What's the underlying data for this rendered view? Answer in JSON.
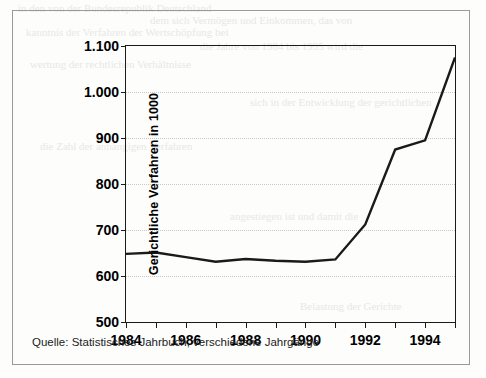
{
  "figure": {
    "background_color": "#fdfdfc",
    "border_color": "#9a9a9a",
    "line_color": "#1a1a1a",
    "grid_color": "#c9c9c9"
  },
  "source_note": "Quelle: Statistisches Jahrbuch, verschiedene Jahrgänge",
  "bleed_text": [
    "in den von der Bundesrepublik Deutschland",
    "dem sich Vermögen und Einkommen, das von",
    "kanntnis der Verfahren der Wertschöpfung bei",
    "die Jahre von 1984 bis 1995 wird die",
    "wertung der rechtlichen Verhältnisse",
    "sich in der Entwicklung der gerichtlichen",
    "die Zahl der anhängigen Verfahren",
    "angestiegen ist und damit die",
    "Belastung der Gerichte"
  ],
  "chart_data": {
    "type": "line",
    "title": "",
    "subtitle": "",
    "xlabel": "",
    "ylabel": "Gerichtliche Verfahren in 1000",
    "xlim": [
      1984,
      1995
    ],
    "ylim": [
      500,
      1100
    ],
    "grid": true,
    "legend": false,
    "legend_position": "none",
    "y_ticks": [
      500,
      600,
      700,
      800,
      900,
      1000,
      1100
    ],
    "y_tick_labels": [
      "500",
      "600",
      "700",
      "800",
      "900",
      "1.000",
      "1.100"
    ],
    "x_ticks": [
      1984,
      1985,
      1986,
      1987,
      1988,
      1989,
      1990,
      1991,
      1992,
      1993,
      1994,
      1995
    ],
    "x_tick_labels": [
      "1984",
      "",
      "1986",
      "",
      "1988",
      "",
      "1990",
      "",
      "1992",
      "",
      "1994",
      ""
    ],
    "x": [
      1984,
      1985,
      1986,
      1987,
      1988,
      1989,
      1990,
      1991,
      1992,
      1993,
      1994,
      1995
    ],
    "values": [
      648,
      651,
      641,
      631,
      637,
      633,
      631,
      636,
      712,
      875,
      895,
      1075
    ],
    "series": [
      {
        "name": "Gerichtliche Verfahren",
        "values": [
          648,
          651,
          641,
          631,
          637,
          633,
          631,
          636,
          712,
          875,
          895,
          1075
        ]
      }
    ]
  }
}
